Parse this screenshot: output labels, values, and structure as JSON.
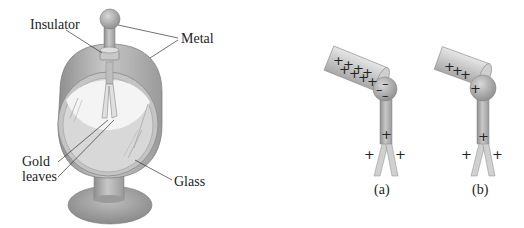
{
  "figure": {
    "left_panel": {
      "name": "gold-leaf electroscope",
      "labels": {
        "insulator": "Insulator",
        "metal": "Metal",
        "gold_leaves_line1": "Gold",
        "gold_leaves_line2": "leaves",
        "glass": "Glass"
      }
    },
    "right_panel": {
      "a": {
        "caption": "(a)",
        "rod_charges": [
          "+",
          "+",
          "+",
          "+",
          "+",
          "+",
          "+",
          "+"
        ],
        "ball_charges": [
          "–",
          "–",
          "–"
        ],
        "stem_charge": "+",
        "leaf_charges": [
          "+",
          "+"
        ]
      },
      "b": {
        "caption": "(b)",
        "rod_charges": [
          "+",
          "+",
          "+"
        ],
        "ball_charge": "+",
        "stem_charge": "+",
        "leaf_charges": [
          "+",
          "+"
        ]
      }
    },
    "colors": {
      "metal_gray": "#a9a9a9",
      "glass_gray": "#d4d4d4",
      "ink": "#222222",
      "background": "#ffffff"
    }
  }
}
